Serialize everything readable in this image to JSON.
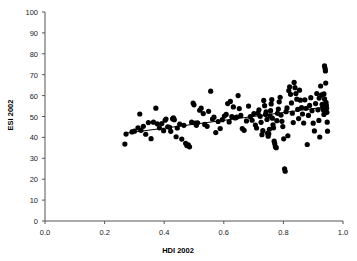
{
  "chart_data": {
    "type": "scatter",
    "title": "",
    "xlabel": "HDI 2002",
    "ylabel": "ESI 2002",
    "xlim": [
      0.0,
      1.0
    ],
    "ylim": [
      0,
      100
    ],
    "xticks": [
      "0.0",
      "0.2",
      "0.4",
      "0.6",
      "0.8",
      "1.0"
    ],
    "xtick_values": [
      0.0,
      0.2,
      0.4,
      0.6,
      0.8,
      1.0
    ],
    "yticks": [
      "0",
      "10",
      "20",
      "30",
      "40",
      "50",
      "60",
      "70",
      "80",
      "90",
      "100"
    ],
    "ytick_values": [
      0,
      10,
      20,
      30,
      40,
      50,
      60,
      70,
      80,
      90,
      100
    ],
    "grid": false,
    "legend": null,
    "marker": {
      "shape": "circle",
      "color": "#000000",
      "size": 3.4
    },
    "trendline": {
      "type": "linear",
      "color": "#000000",
      "width": 1,
      "x_start": 0.265,
      "y_start": 41.9,
      "x_end": 0.945,
      "y_end": 54.6
    },
    "points": [
      [
        0.268,
        36.8
      ],
      [
        0.272,
        41.6
      ],
      [
        0.292,
        42.6
      ],
      [
        0.3,
        43.0
      ],
      [
        0.312,
        44.6
      ],
      [
        0.318,
        51.2
      ],
      [
        0.322,
        43.4
      ],
      [
        0.33,
        45.3
      ],
      [
        0.338,
        41.5
      ],
      [
        0.347,
        47.1
      ],
      [
        0.356,
        39.4
      ],
      [
        0.364,
        47.3
      ],
      [
        0.372,
        54.0
      ],
      [
        0.377,
        46.5
      ],
      [
        0.384,
        44.6
      ],
      [
        0.392,
        46.6
      ],
      [
        0.398,
        43.2
      ],
      [
        0.403,
        48.2
      ],
      [
        0.406,
        48.8
      ],
      [
        0.412,
        45.1
      ],
      [
        0.418,
        44.8
      ],
      [
        0.422,
        42.9
      ],
      [
        0.428,
        48.9
      ],
      [
        0.431,
        49.3
      ],
      [
        0.434,
        48.5
      ],
      [
        0.44,
        40.3
      ],
      [
        0.444,
        44.5
      ],
      [
        0.452,
        46.4
      ],
      [
        0.459,
        39.2
      ],
      [
        0.466,
        45.8
      ],
      [
        0.472,
        37.2
      ],
      [
        0.476,
        36.1
      ],
      [
        0.481,
        36.4
      ],
      [
        0.485,
        35.5
      ],
      [
        0.492,
        47.3
      ],
      [
        0.497,
        56.4
      ],
      [
        0.5,
        55.6
      ],
      [
        0.504,
        46.9
      ],
      [
        0.508,
        45.8
      ],
      [
        0.512,
        47.0
      ],
      [
        0.519,
        53.0
      ],
      [
        0.524,
        54.0
      ],
      [
        0.531,
        51.4
      ],
      [
        0.536,
        46.2
      ],
      [
        0.544,
        45.3
      ],
      [
        0.549,
        52.5
      ],
      [
        0.556,
        62.1
      ],
      [
        0.562,
        48.8
      ],
      [
        0.567,
        49.7
      ],
      [
        0.573,
        42.3
      ],
      [
        0.581,
        47.6
      ],
      [
        0.588,
        44.2
      ],
      [
        0.595,
        48.5
      ],
      [
        0.602,
        50.2
      ],
      [
        0.608,
        51.0
      ],
      [
        0.613,
        56.2
      ],
      [
        0.618,
        47.4
      ],
      [
        0.622,
        57.2
      ],
      [
        0.627,
        49.9
      ],
      [
        0.632,
        54.6
      ],
      [
        0.638,
        49.3
      ],
      [
        0.643,
        49.7
      ],
      [
        0.648,
        60.0
      ],
      [
        0.652,
        53.8
      ],
      [
        0.657,
        50.5
      ],
      [
        0.662,
        44.2
      ],
      [
        0.668,
        43.4
      ],
      [
        0.676,
        47.9
      ],
      [
        0.683,
        55.0
      ],
      [
        0.689,
        49.9
      ],
      [
        0.695,
        48.2
      ],
      [
        0.701,
        51.4
      ],
      [
        0.706,
        45.9
      ],
      [
        0.71,
        44.5
      ],
      [
        0.715,
        51.6
      ],
      [
        0.718,
        53.2
      ],
      [
        0.722,
        50.1
      ],
      [
        0.725,
        47.2
      ],
      [
        0.728,
        41.3
      ],
      [
        0.731,
        43.2
      ],
      [
        0.734,
        57.7
      ],
      [
        0.737,
        55.2
      ],
      [
        0.74,
        51.0
      ],
      [
        0.742,
        52.2
      ],
      [
        0.745,
        48.6
      ],
      [
        0.747,
        42.0
      ],
      [
        0.749,
        40.6
      ],
      [
        0.751,
        41.7
      ],
      [
        0.753,
        43.9
      ],
      [
        0.755,
        50.3
      ],
      [
        0.757,
        52.8
      ],
      [
        0.759,
        56.0
      ],
      [
        0.761,
        58.1
      ],
      [
        0.763,
        49.2
      ],
      [
        0.765,
        46.0
      ],
      [
        0.767,
        44.6
      ],
      [
        0.769,
        38.2
      ],
      [
        0.771,
        37.0
      ],
      [
        0.773,
        35.5
      ],
      [
        0.776,
        35.1
      ],
      [
        0.778,
        48.0
      ],
      [
        0.78,
        51.5
      ],
      [
        0.783,
        53.6
      ],
      [
        0.786,
        57.0
      ],
      [
        0.789,
        59.2
      ],
      [
        0.792,
        50.7
      ],
      [
        0.795,
        47.7
      ],
      [
        0.798,
        45.2
      ],
      [
        0.801,
        39.3
      ],
      [
        0.804,
        25.0
      ],
      [
        0.806,
        23.8
      ],
      [
        0.809,
        52.3
      ],
      [
        0.812,
        54.1
      ],
      [
        0.815,
        40.8
      ],
      [
        0.818,
        62.4
      ],
      [
        0.821,
        64.2
      ],
      [
        0.824,
        60.6
      ],
      [
        0.827,
        56.5
      ],
      [
        0.83,
        51.6
      ],
      [
        0.833,
        47.1
      ],
      [
        0.836,
        66.3
      ],
      [
        0.839,
        63.8
      ],
      [
        0.842,
        61.0
      ],
      [
        0.845,
        58.3
      ],
      [
        0.848,
        53.4
      ],
      [
        0.851,
        49.0
      ],
      [
        0.854,
        62.6
      ],
      [
        0.857,
        57.8
      ],
      [
        0.861,
        54.3
      ],
      [
        0.864,
        51.2
      ],
      [
        0.868,
        46.9
      ],
      [
        0.872,
        58.0
      ],
      [
        0.876,
        53.9
      ],
      [
        0.88,
        36.6
      ],
      [
        0.884,
        50.5
      ],
      [
        0.888,
        55.3
      ],
      [
        0.892,
        59.0
      ],
      [
        0.896,
        52.8
      ],
      [
        0.9,
        46.8
      ],
      [
        0.904,
        43.1
      ],
      [
        0.908,
        56.2
      ],
      [
        0.912,
        61.0
      ],
      [
        0.916,
        53.2
      ],
      [
        0.919,
        48.1
      ],
      [
        0.922,
        40.2
      ],
      [
        0.925,
        64.6
      ],
      [
        0.928,
        60.3
      ],
      [
        0.93,
        55.8
      ],
      [
        0.932,
        54.2
      ],
      [
        0.934,
        53.1
      ],
      [
        0.936,
        51.0
      ],
      [
        0.938,
        74.2
      ],
      [
        0.94,
        73.0
      ],
      [
        0.941,
        71.8
      ],
      [
        0.942,
        66.0
      ],
      [
        0.943,
        56.8
      ],
      [
        0.944,
        55.4
      ],
      [
        0.945,
        54.0
      ],
      [
        0.946,
        52.0
      ],
      [
        0.947,
        47.3
      ],
      [
        0.948,
        43.0
      ],
      [
        0.938,
        58.4
      ],
      [
        0.936,
        60.8
      ],
      [
        0.92,
        58.8
      ]
    ]
  }
}
